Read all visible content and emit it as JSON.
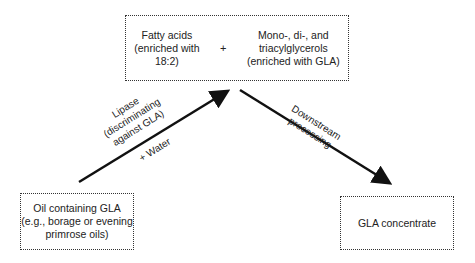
{
  "diagram": {
    "top_box": {
      "left": [
        "Fatty acids",
        "(enriched with",
        "18:2)"
      ],
      "plus": "+",
      "right": [
        "Mono-, di-, and",
        "triacylglycerols",
        "(enriched with GLA)"
      ]
    },
    "left_box": [
      "Oil containing GLA",
      "(e.g., borage or evening",
      "primrose oils)"
    ],
    "right_box": [
      "GLA concentrate"
    ],
    "left_arrow_label": [
      "Lipase",
      "(discriminating",
      "against GLA)"
    ],
    "left_arrow_sublabel": "+ Water",
    "right_arrow_label": [
      "Downstream",
      "processing"
    ],
    "colors": {
      "arrow": "#111111",
      "border": "#333333",
      "text": "#222222"
    }
  }
}
